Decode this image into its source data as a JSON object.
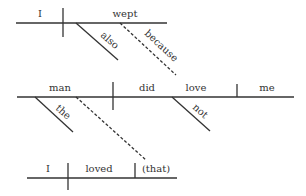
{
  "diagram": {
    "type": "sentence-diagram",
    "clauses": [
      {
        "id": "clause-1",
        "subject": "I",
        "verb": "wept",
        "modifiers": [
          {
            "word": "also",
            "modifies": "wept",
            "style": "solid"
          },
          {
            "word": "because",
            "modifies": "wept",
            "style": "dashed",
            "connects_to": "clause-2.verb"
          }
        ]
      },
      {
        "id": "clause-2",
        "subject": "man",
        "verb_aux": "did",
        "verb": "love",
        "object": "me",
        "modifiers": [
          {
            "word": "the",
            "modifies": "man",
            "style": "solid"
          },
          {
            "word": "not",
            "modifies": "love",
            "style": "solid"
          },
          {
            "word": "",
            "modifies": "man",
            "style": "dashed",
            "connects_to": "clause-3.object"
          }
        ]
      },
      {
        "id": "clause-3",
        "subject": "I",
        "verb": "loved",
        "object": "(that)"
      }
    ]
  },
  "labels": {
    "c1_subject": "I",
    "c1_verb": "wept",
    "c1_also": "also",
    "c1_because": "because",
    "c2_subject": "man",
    "c2_aux": "did",
    "c2_verb": "love",
    "c2_object": "me",
    "c2_the": "the",
    "c2_not": "not",
    "c3_subject": "I",
    "c3_verb": "loved",
    "c3_object": "(that)"
  }
}
